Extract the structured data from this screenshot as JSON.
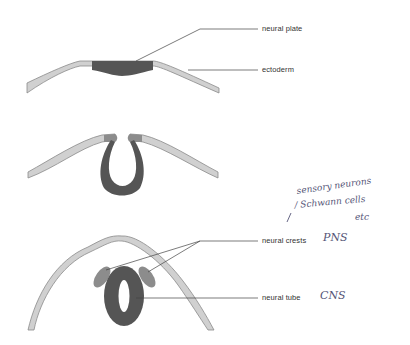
{
  "colors": {
    "ectoderm_fill": "#d0d0d0",
    "ectoderm_stroke": "#8a8a8a",
    "neural_plate": "#555555",
    "neural_tube": "#555555",
    "neural_crest": "#8c8c8c",
    "leader_line": "#444444",
    "label_text": "#333333",
    "handwriting": "#555577"
  },
  "stages": [
    {
      "name": "neural-plate-stage",
      "labels": [
        "neural plate",
        "ectoderm"
      ]
    },
    {
      "name": "neural-groove-stage",
      "labels": []
    },
    {
      "name": "neural-tube-stage",
      "labels": [
        "neural crests",
        "neural tube"
      ]
    }
  ],
  "labels": {
    "neural_plate": "neural plate",
    "ectoderm": "ectoderm",
    "neural_crests": "neural crests",
    "neural_tube": "neural tube"
  },
  "annotations": {
    "pns": "PNS",
    "cns": "CNS",
    "sensory_line1": "sensory neurons",
    "sensory_line2": "/ Schwann cells",
    "sensory_line3": "etc"
  }
}
